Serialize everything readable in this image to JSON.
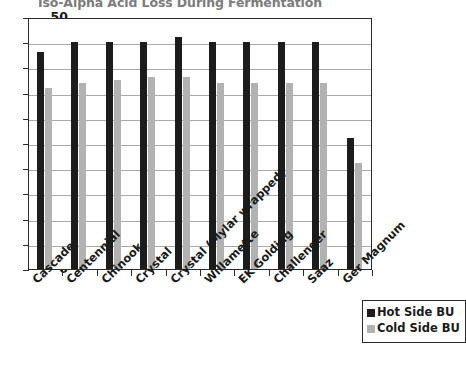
{
  "chart_data": {
    "type": "bar",
    "title": "Iso-Alpha Acid Loss During Fermentation",
    "xlabel": "",
    "ylabel": "",
    "ylim": [
      0,
      50
    ],
    "yticks": [
      0,
      5,
      10,
      15,
      20,
      25,
      30,
      35,
      40,
      45,
      50
    ],
    "ytick_labels": [
      "0",
      "5",
      "10",
      "15",
      "20",
      "25",
      "30",
      "35",
      "40",
      "45",
      "50"
    ],
    "grid": true,
    "legend_position": "bottom-right",
    "categories": [
      "Cascade",
      "Centennial",
      "Chinook",
      "Crystal",
      "Crystal (Mylar wrapped)",
      "Willamette",
      "EK Golding",
      "Challenger",
      "Saaz",
      "Ger Magnum"
    ],
    "series": [
      {
        "name": "Hot Side BU",
        "color": "#1c1c1c",
        "values": [
          43,
          45,
          45,
          45,
          46,
          45,
          45,
          45,
          45,
          26
        ]
      },
      {
        "name": "Cold Side BU",
        "color": "#b2b2b2",
        "values": [
          36,
          37,
          37.5,
          38,
          38,
          37,
          37,
          37,
          37,
          21
        ]
      }
    ]
  },
  "legend": {
    "entries": [
      {
        "label": "Hot Side BU",
        "color": "#1c1c1c"
      },
      {
        "label": "Cold Side BU",
        "color": "#b2b2b2"
      }
    ]
  },
  "colors": {
    "hot": "#1c1c1c",
    "cold": "#b2b2b2",
    "axis": "#2b2b2b",
    "grid": "#aaaaaa",
    "title": "#7c7c7c",
    "background": "#ffffff"
  }
}
